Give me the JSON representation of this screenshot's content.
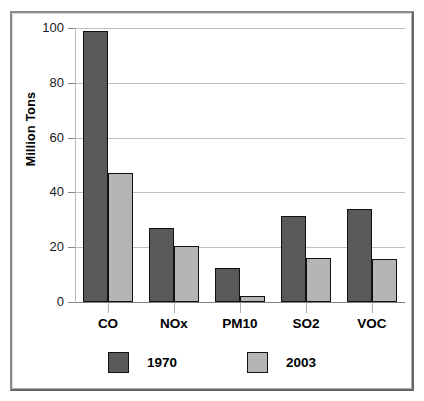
{
  "chart_data": {
    "type": "bar",
    "title": "",
    "xlabel": "",
    "ylabel": "Million Tons",
    "categories": [
      "CO",
      "NOx",
      "PM10",
      "SO2",
      "VOC"
    ],
    "series": [
      {
        "name": "1970",
        "color": "#595959",
        "values": [
          99,
          27,
          12.5,
          31.5,
          34
        ]
      },
      {
        "name": "2003",
        "color": "#b5b5b5",
        "values": [
          47,
          20.5,
          2.3,
          16,
          15.8
        ]
      }
    ],
    "ylim": [
      0,
      100
    ],
    "yticks": [
      0,
      20,
      40,
      60,
      80,
      100
    ],
    "ytick_labels": [
      "0",
      "20",
      "40",
      "60",
      "80",
      "100"
    ],
    "grid": true,
    "legend_position": "bottom"
  },
  "legend": {
    "entries": [
      {
        "label": "1970",
        "color": "#595959"
      },
      {
        "label": "2003",
        "color": "#b5b5b5"
      }
    ]
  },
  "colors": {
    "series_1970": "#595959",
    "series_2003": "#b5b5b5",
    "gridline": "#bfbfbf",
    "frame": "#8a8a8a",
    "text": "#000000"
  }
}
